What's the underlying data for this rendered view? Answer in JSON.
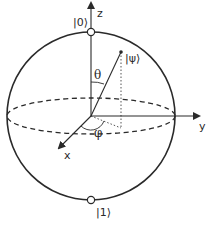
{
  "diagram": {
    "colors": {
      "stroke": "#2a2a2a",
      "background": "#ffffff",
      "pole_fill": "#ffffff"
    },
    "axes": {
      "z_label": "z",
      "y_label": "y",
      "x_label": "x"
    },
    "states": {
      "north_pole": "|0⟩",
      "south_pole": "|1⟩",
      "psi": "|ψ⟩"
    },
    "angles": {
      "polar": "θ",
      "azimuthal": "φ"
    }
  }
}
